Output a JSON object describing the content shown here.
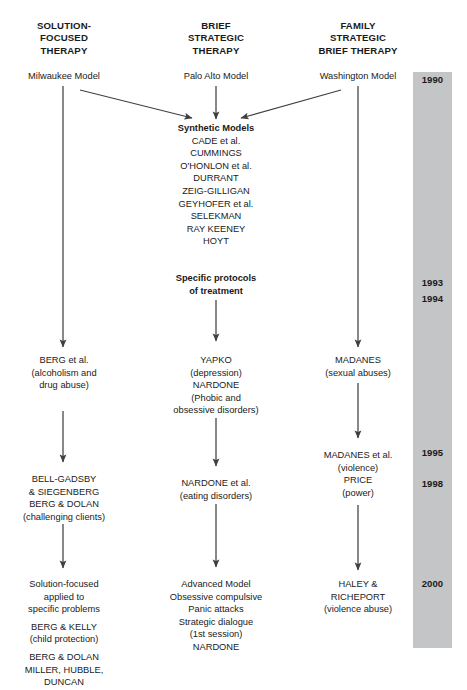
{
  "diagram": {
    "background_color": "#ffffff",
    "timeline_color": "#c3c5c7",
    "line_color": "#404040"
  },
  "columns": [
    {
      "id": "solution-focused",
      "header": "SOLUTION-\nFOCUSED\nTHERAPY",
      "header_lines": [
        "SOLUTION-",
        "FOCUSED",
        "THERAPY"
      ]
    },
    {
      "id": "brief-strategic",
      "header": "BRIEF\nSTRATEGIC\nTHERAPY",
      "header_lines": [
        "BRIEF",
        "STRATEGIC",
        "THERAPY"
      ]
    },
    {
      "id": "family-strategic",
      "header": "FAMILY\nSTRATEGIC\nBRIEF THERAPY",
      "header_lines": [
        "FAMILY",
        "STRATEGIC",
        "BRIEF THERAPY"
      ]
    }
  ],
  "headers": {
    "left_line1": "SOLUTION-",
    "left_line2": "FOCUSED",
    "left_line3": "THERAPY",
    "mid_line1": "BRIEF",
    "mid_line2": "STRATEGIC",
    "mid_line3": "THERAPY",
    "right_line1": "FAMILY",
    "right_line2": "STRATEGIC",
    "right_line3": "BRIEF THERAPY"
  },
  "roots": {
    "left": "Milwaukee Model",
    "mid": "Palo Alto Model",
    "right": "Washington Model"
  },
  "synthetic": {
    "title": "Synthetic Models",
    "authors": [
      "CADE et al.",
      "CUMMINGS",
      "O'HONLON et al.",
      "DURRANT",
      "ZEIG-GILLIGAN",
      "GEYHOFER et al.",
      "SELEKMAN",
      "RAY KEENEY",
      "HOYT"
    ]
  },
  "protocols": {
    "line1": "Specific protocols",
    "line2": "of treatment"
  },
  "mid_nodes": {
    "yapko": {
      "lines": [
        "YAPKO",
        "(depression)",
        "NARDONE",
        "(Phobic and",
        "obsessive disorders)"
      ]
    },
    "nardone_eating": {
      "lines": [
        "NARDONE et al.",
        "(eating disorders)"
      ]
    },
    "advanced": {
      "lines": [
        "Advanced Model",
        "Obsessive compulsive",
        "Panic attacks",
        "Strategic dialogue",
        "(1st session)",
        "NARDONE"
      ]
    }
  },
  "left_nodes": {
    "berg": {
      "lines": [
        "BERG et al.",
        "(alcoholism and",
        "drug abuse)"
      ]
    },
    "bell_gadsby": {
      "lines": [
        "BELL-GADSBY",
        "& SIEGENBERG",
        "BERG & DOLAN",
        "(challenging clients)"
      ]
    },
    "solution_applied": {
      "group1": [
        "Solution-focused",
        "applied to",
        "specific problems"
      ],
      "group2": [
        "BERG & KELLY",
        "(child protection)"
      ],
      "group3": [
        "BERG & DOLAN",
        "MILLER, HUBBLE,",
        "DUNCAN"
      ]
    }
  },
  "right_nodes": {
    "madanes": {
      "lines": [
        "MADANES",
        "(sexual abuses)"
      ]
    },
    "madanes_price": {
      "lines": [
        "MADANES et al.",
        "(violence)",
        "PRICE",
        "(power)"
      ]
    },
    "haley": {
      "lines": [
        "HALEY &",
        "RICHEPORT",
        "(violence abuse)"
      ]
    }
  },
  "timeline": {
    "years": [
      {
        "label": "1990",
        "top": 74
      },
      {
        "label": "1993",
        "top": 277
      },
      {
        "label": "1994",
        "top": 293
      },
      {
        "label": "1995",
        "top": 447
      },
      {
        "label": "1998",
        "top": 478
      },
      {
        "label": "2000",
        "top": 578
      }
    ],
    "year_1990": "1990",
    "year_1993": "1993",
    "year_1994": "1994",
    "year_1995": "1995",
    "year_1998": "1998",
    "year_2000": "2000"
  }
}
